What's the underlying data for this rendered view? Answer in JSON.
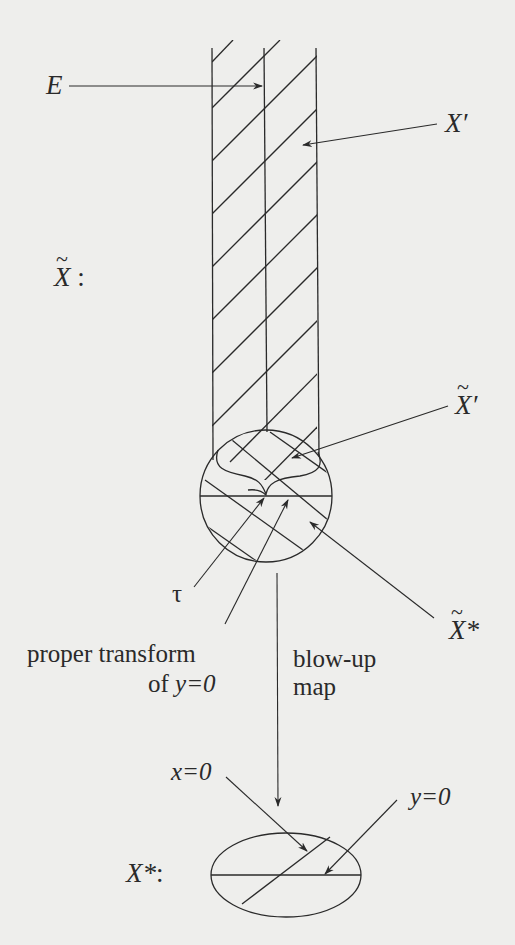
{
  "figure": {
    "labels": {
      "E": "E",
      "X_prime": "X′",
      "X_tilde": "X",
      "X_tilde_colon": ":",
      "X_tilde_prime": "X′",
      "tau": "τ",
      "X_tilde_star": "X*",
      "proper_transform_line1": "proper transform",
      "proper_transform_line2_prefix": "of ",
      "proper_transform_line2_eq": "y=0",
      "blowup_line1": "blow-up",
      "blowup_line2": "map",
      "x_eq_0": "x=0",
      "y_eq_0": "y=0",
      "X_star": "X*",
      "X_star_colon": ":",
      "tilde_glyph": "~"
    },
    "colors": {
      "background": "#eeeeec",
      "ink": "#2a2a2a"
    }
  }
}
